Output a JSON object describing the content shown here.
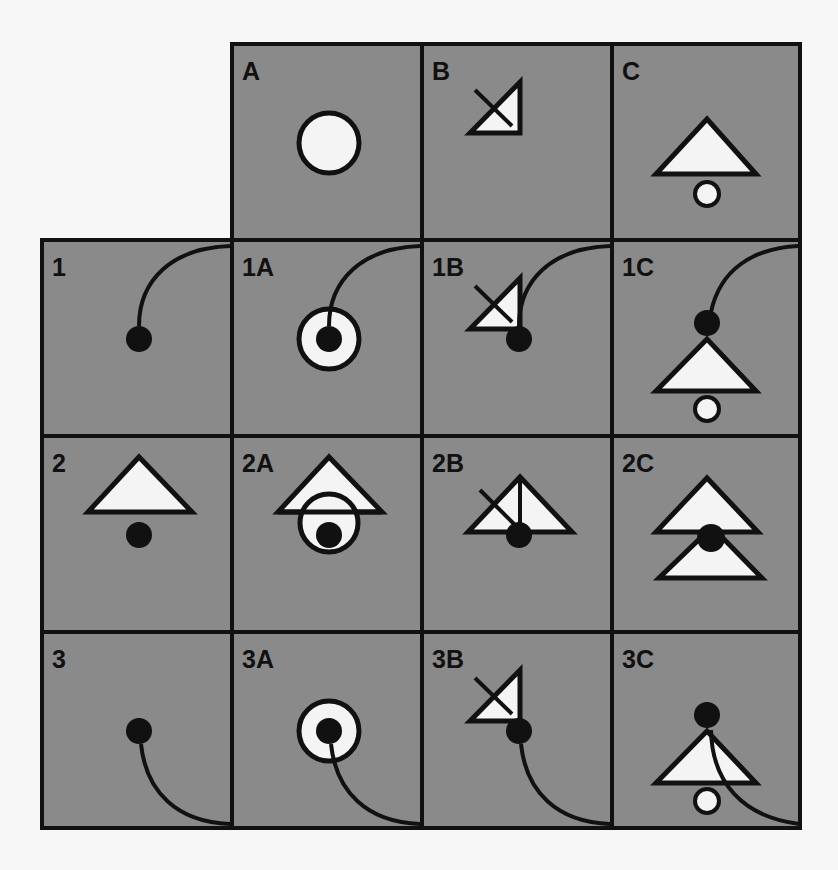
{
  "colors": {
    "background": "#f7f7f7",
    "cell_fill": "#8a8a8a",
    "stroke": "#111111",
    "symbol_fill": "#f4f4f4",
    "dot": "#111111"
  },
  "grid": {
    "col_x": [
      42,
      232,
      422,
      612,
      800
    ],
    "row_y": [
      44,
      240,
      436,
      632,
      828
    ],
    "column_headers": [
      "A",
      "B",
      "C"
    ],
    "row_headers": [
      "1",
      "2",
      "3"
    ]
  },
  "cells": [
    {
      "label": "A",
      "col": 1,
      "row": 0,
      "symbols": [
        "circle"
      ]
    },
    {
      "label": "B",
      "col": 2,
      "row": 0,
      "symbols": [
        "right-triangle-cross"
      ]
    },
    {
      "label": "C",
      "col": 3,
      "row": 0,
      "symbols": [
        "triangle-small-circle"
      ]
    },
    {
      "label": "1",
      "col": 0,
      "row": 1,
      "symbols": [
        "dot",
        "tail-up"
      ]
    },
    {
      "label": "1A",
      "col": 1,
      "row": 1,
      "symbols": [
        "circle",
        "dot",
        "tail-up"
      ]
    },
    {
      "label": "1B",
      "col": 2,
      "row": 1,
      "symbols": [
        "right-triangle-cross",
        "dot",
        "tail-up"
      ]
    },
    {
      "label": "1C",
      "col": 3,
      "row": 1,
      "symbols": [
        "triangle-small-circle-low",
        "dot-high",
        "tail-up-high"
      ]
    },
    {
      "label": "2",
      "col": 0,
      "row": 2,
      "symbols": [
        "triangle-high",
        "dot"
      ]
    },
    {
      "label": "2A",
      "col": 1,
      "row": 2,
      "symbols": [
        "circle-under-triangle",
        "dot"
      ]
    },
    {
      "label": "2B",
      "col": 2,
      "row": 2,
      "symbols": [
        "triangle-vertical-cross",
        "dot"
      ]
    },
    {
      "label": "2C",
      "col": 3,
      "row": 2,
      "symbols": [
        "double-triangle",
        "dot-mid"
      ]
    },
    {
      "label": "3",
      "col": 0,
      "row": 3,
      "symbols": [
        "dot",
        "tail-down"
      ]
    },
    {
      "label": "3A",
      "col": 1,
      "row": 3,
      "symbols": [
        "circle",
        "dot",
        "tail-down"
      ]
    },
    {
      "label": "3B",
      "col": 2,
      "row": 3,
      "symbols": [
        "right-triangle-cross",
        "dot",
        "tail-down"
      ]
    },
    {
      "label": "3C",
      "col": 3,
      "row": 3,
      "symbols": [
        "triangle-small-circle-low",
        "dot-high",
        "tail-down-through"
      ]
    }
  ]
}
